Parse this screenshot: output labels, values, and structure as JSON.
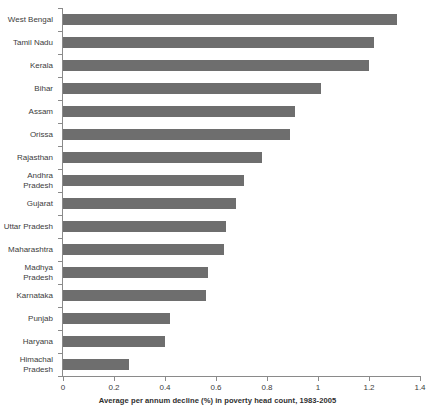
{
  "chart_data": {
    "type": "bar",
    "orientation": "horizontal",
    "title": "",
    "xlabel": "Average per annum decline (%) in poverty head count, 1983-2005",
    "ylabel": "",
    "xlim": [
      0,
      1.4
    ],
    "xticks": [
      "0",
      "0.2",
      "0.4",
      "0.6",
      "0.8",
      "1",
      "1.2",
      "1.4"
    ],
    "xtick_values": [
      0,
      0.2,
      0.4,
      0.6,
      0.8,
      1,
      1.2,
      1.4
    ],
    "grid": false,
    "legend": null,
    "bar_color": "#6e6e6e",
    "categories": [
      "West Bengal",
      "Tamil Nadu",
      "Kerala",
      "Bihar",
      "Assam",
      "Orissa",
      "Rajasthan",
      "Andhra Pradesh",
      "Gujarat",
      "Uttar Pradesh",
      "Maharashtra",
      "Madhya Pradesh",
      "Karnataka",
      "Punjab",
      "Haryana",
      "Himachal Pradesh"
    ],
    "values": [
      1.31,
      1.22,
      1.2,
      1.01,
      0.91,
      0.89,
      0.78,
      0.71,
      0.68,
      0.64,
      0.63,
      0.57,
      0.56,
      0.42,
      0.4,
      0.26
    ]
  }
}
